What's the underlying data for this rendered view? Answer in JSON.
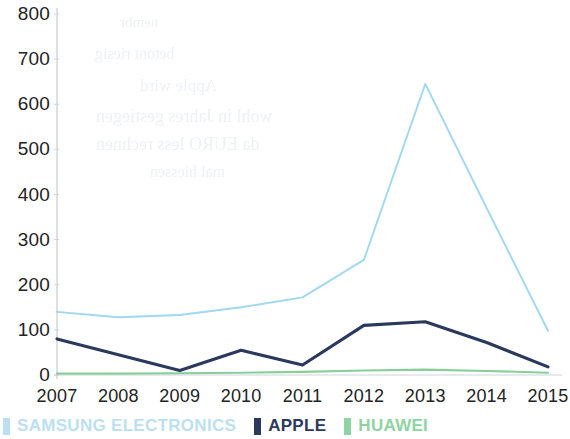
{
  "chart_data": {
    "type": "line",
    "title": "",
    "subtitle": "",
    "xlabel": "",
    "ylabel": "",
    "x": [
      2007,
      2008,
      2009,
      2010,
      2011,
      2012,
      2013,
      2014,
      2015
    ],
    "xtick_labels": [
      "2007",
      "2008",
      "2009",
      "2010",
      "2011",
      "2012",
      "2013",
      "2014",
      "2015"
    ],
    "ytick_labels": [
      "0",
      "100",
      "200",
      "300",
      "400",
      "500",
      "600",
      "700",
      "800"
    ],
    "yticks": [
      0,
      100,
      200,
      300,
      400,
      500,
      600,
      700,
      800
    ],
    "ylim": [
      0,
      800
    ],
    "xlim": [
      2007,
      2015
    ],
    "grid": false,
    "legend_position": "bottom-left",
    "series": [
      {
        "name": "SAMSUNG ELECTRONICS",
        "color": "#9fd8ef",
        "values": [
          140,
          128,
          133,
          150,
          172,
          255,
          645,
          370,
          98
        ]
      },
      {
        "name": "APPLE",
        "color": "#2b3a5c",
        "values": [
          80,
          45,
          10,
          55,
          22,
          110,
          118,
          72,
          18
        ]
      },
      {
        "name": "HUAWEI",
        "color": "#87cf9a",
        "values": [
          3,
          3,
          4,
          5,
          7,
          10,
          12,
          9,
          5
        ]
      }
    ]
  },
  "legend": {
    "items": [
      {
        "label": "SAMSUNG ELECTRONICS",
        "color": "#bcdff2"
      },
      {
        "label": "APPLE",
        "color": "#2b3a5c"
      },
      {
        "label": "HUAWEI",
        "color": "#8ed3a3"
      }
    ]
  },
  "axis": {
    "line_color": "#cfd4d9"
  },
  "artifacts": {
    "ghost_lines": [
      {
        "text": "nembr",
        "x": 120,
        "y": 14,
        "size": 15
      },
      {
        "text": "betont riesig",
        "x": 95,
        "y": 45,
        "size": 16
      },
      {
        "text": "Apple wird",
        "x": 140,
        "y": 76,
        "size": 17
      },
      {
        "text": "wohl in Jahres gestiegen",
        "x": 96,
        "y": 106,
        "size": 18
      },
      {
        "text": "da EURO less rechnen",
        "x": 96,
        "y": 134,
        "size": 18
      },
      {
        "text": "mal hiessen",
        "x": 150,
        "y": 163,
        "size": 16
      }
    ]
  }
}
